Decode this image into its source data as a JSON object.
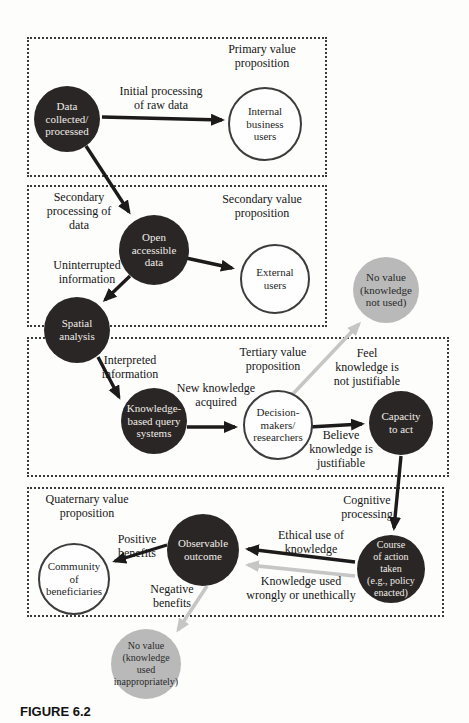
{
  "figure_caption": "FIGURE 6.2",
  "colors": {
    "dark_node": "#2a2626",
    "dark_node_text": "#f0ece6",
    "white_node_border": "#3c3c3c",
    "gray_node": "#b9b9b9",
    "black_arrow": "#1c1a1a",
    "gray_arrow": "#c6c6c6",
    "dotted_border": "#3a3a3a"
  },
  "sections": {
    "primary": {
      "label": "Primary value\nproposition"
    },
    "secondary": {
      "label": "Secondary value\nproposition"
    },
    "tertiary": {
      "label": "Tertiary value\nproposition"
    },
    "quaternary": {
      "label": "Quaternary value\nproposition"
    }
  },
  "nodes": {
    "data_collected": {
      "label": "Data\ncollected/\nprocessed",
      "type": "dark"
    },
    "internal_users": {
      "label": "Internal\nbusiness\nusers",
      "type": "white"
    },
    "open_data": {
      "label": "Open\naccessible\ndata",
      "type": "dark"
    },
    "external_users": {
      "label": "External\nusers",
      "type": "white"
    },
    "spatial_analysis": {
      "label": "Spatial\nanalysis",
      "type": "dark"
    },
    "no_value_not_used": {
      "label": "No value\n(knowledge\nnot used)",
      "type": "gray"
    },
    "kb_query_systems": {
      "label": "Knowledge-\nbased query\nsystems",
      "type": "dark"
    },
    "decision_makers": {
      "label": "Decision-\nmakers/\nresearchers",
      "type": "white"
    },
    "capacity_to_act": {
      "label": "Capacity\nto act",
      "type": "dark"
    },
    "course_of_action": {
      "label": "Course\nof action\ntaken\n(e.g., policy\nenacted)",
      "type": "dark"
    },
    "observable_outcome": {
      "label": "Observable\noutcome",
      "type": "dark"
    },
    "community": {
      "label": "Community\nof\nbeneficiaries",
      "type": "white"
    },
    "no_value_inappropriate": {
      "label": "No value\n(knowledge\nused\ninappropriately)",
      "type": "gray"
    }
  },
  "edge_labels": {
    "initial_processing": "Initial processing\nof raw data",
    "secondary_processing": "Secondary\nprocessing of\ndata",
    "uninterrupted": "Uninterrupted\ninformation",
    "interpreted": "Interpreted\ninformation",
    "new_knowledge": "New knowledge\nacquired",
    "feel_not_justifiable": "Feel\nknowledge is\nnot justifiable",
    "believe_justifiable": "Believe\nknowledge is\njustifiable",
    "cognitive_processing": "Cognitive\nprocessing",
    "ethical_use": "Ethical use of\nknowledge",
    "used_wrongly": "Knowledge used\nwrongly or unethically",
    "positive_benefits": "Positive\nbenefits",
    "negative_benefits": "Negative\nbenefits"
  }
}
